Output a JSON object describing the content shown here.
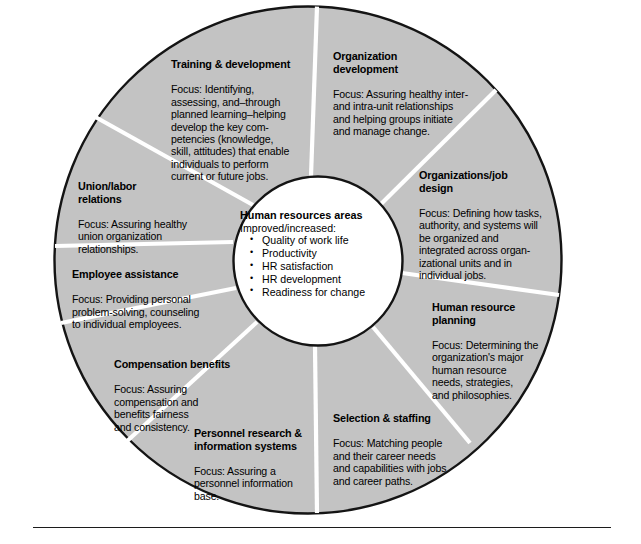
{
  "diagram": {
    "colors": {
      "segment_fill": "#c3c3c3",
      "segment_divider": "#ffffff",
      "outline": "#141414",
      "center_fill": "#ffffff",
      "text": "#000000",
      "page_background": "#ffffff",
      "rule": "#1c1c1c"
    },
    "center": {
      "title": "Human resources areas",
      "subtitle": "Improved/increased:",
      "items": [
        "Quality of work life",
        "Productivity",
        "HR satisfaction",
        "HR development",
        "Readiness for change"
      ]
    },
    "segments": [
      {
        "id": "training-development",
        "title": "Training & development",
        "body": "Focus: Identifying,\nassessing, and–through\nplanned learning–helping\ndevelop the key com-\npetencies (knowledge,\nskill, attitudes) that enable\nindividuals to perform\ncurrent or future jobs."
      },
      {
        "id": "organization-development",
        "title": "Organization\ndevelopment",
        "body": "Focus: Assuring healthy inter-\nand intra-unit relationships\nand helping groups initiate\nand manage change."
      },
      {
        "id": "organizations-job-design",
        "title": "Organizations/job\ndesign",
        "body": "Focus: Defining how tasks,\nauthority, and systems will\nbe organized and\nintegrated across organ-\nizational units and in\nindividual jobs."
      },
      {
        "id": "human-resource-planning",
        "title": "Human resource\nplanning",
        "body": "Focus: Determining the\norganization's major\nhuman resource\nneeds, strategies,\nand philosophies."
      },
      {
        "id": "selection-staffing",
        "title": "Selection & staffing",
        "body": "Focus: Matching people\nand their career needs\nand  capabilities with jobs\nand career paths."
      },
      {
        "id": "personnel-research-information-systems",
        "title": "Personnel research &\ninformation systems",
        "body": "Focus: Assuring a\npersonnel information\nbase."
      },
      {
        "id": "compensation-benefits",
        "title": "Compensation benefits",
        "body": "Focus: Assuring\ncompensation and\nbenefits fairness\nand consistency."
      },
      {
        "id": "employee-assistance",
        "title": "Employee assistance",
        "body": "Focus: Providing  personal\nproblem-solving, counseling\nto individual employees."
      },
      {
        "id": "union-labor-relations",
        "title": "Union/labor\nrelations",
        "body": "Focus: Assuring healthy\nunion organization\nrelationships."
      }
    ],
    "geometry": {
      "outer_center_x": 308,
      "outer_center_y": 260,
      "outer_radius": 254,
      "inner_center_x": 318,
      "inner_center_y": 261,
      "inner_radius": 85,
      "spoke_angles_deg": [
        2,
        48,
        98,
        140,
        182,
        226,
        256,
        283,
        311
      ]
    }
  }
}
